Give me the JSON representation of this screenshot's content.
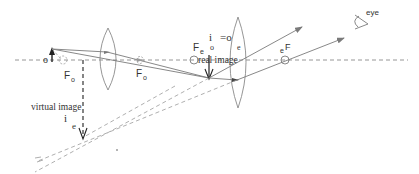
{
  "diagram": {
    "type": "compound microscope ray diagram",
    "colors": {
      "stroke": "#7a7a7a",
      "dark": "#222222",
      "axis": "#8a8a8a",
      "text": "#333333"
    },
    "labels": {
      "object": "o",
      "objective_focus_left": "F",
      "objective_focus_left_sub": "o",
      "objective_focus_right": "F",
      "objective_focus_right_sub": "o",
      "eyepiece_focus_left": "F",
      "eyepiece_focus_left_sub": "e",
      "eyepiece_focus_right_pre": "e",
      "eyepiece_focus_right": "F",
      "intermediate_image_i": "i",
      "intermediate_image_i_sub": "o",
      "equals_o": "=o",
      "equals_o_sub": "e",
      "real_image": "real image",
      "virtual_image": "virtual image",
      "final_image_i": "i",
      "final_image_i_sub": "e",
      "eye": "eye"
    }
  }
}
